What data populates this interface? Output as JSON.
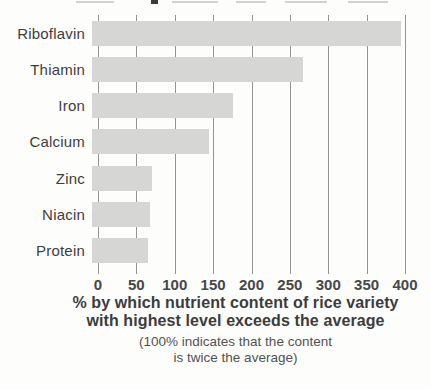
{
  "chart_data": {
    "type": "bar",
    "orientation": "horizontal",
    "title": "",
    "categories": [
      "Riboflavin",
      "Thiamin",
      "Iron",
      "Calcium",
      "Zinc",
      "Niacin",
      "Protein"
    ],
    "values": [
      395,
      270,
      180,
      150,
      77,
      74,
      72
    ],
    "x_ticks": [
      0,
      50,
      100,
      150,
      200,
      250,
      300,
      350,
      400
    ],
    "xlim": [
      0,
      400
    ],
    "grid": true,
    "legend": "none",
    "xlabel_line1": "% by which nutrient content of rice variety",
    "xlabel_line2": "with highest level exceeds the average",
    "note_line1": "(100% indicates that the content",
    "note_line2": "is twice the average)",
    "ylabel": "",
    "bar_color": "#d6d6d4",
    "grid_color": "#949494",
    "label_color": "#3e3e3e",
    "tick_label_color": "#474747",
    "background_color": "#fdfdfc"
  }
}
